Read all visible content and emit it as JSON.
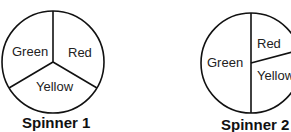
{
  "spinners": [
    {
      "caption": "Spinner 1",
      "sections": [
        "Green",
        "Red",
        "Yellow"
      ]
    },
    {
      "caption": "Spinner 2",
      "sections": [
        "Green",
        "Red",
        "Yellow"
      ]
    }
  ]
}
